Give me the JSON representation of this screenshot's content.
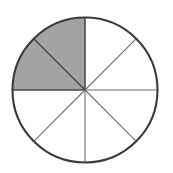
{
  "figure": {
    "kind": "fraction-circle",
    "alt_text": "A circle divided into 8 equal sectors; the two sectors forming the upper-left quarter are shaded gray, the other six are white."
  },
  "geometry": {
    "center_x": 85,
    "center_y": 90,
    "radius": 72.5,
    "total_sectors": 8,
    "sector_angle_degrees": 45,
    "start_angle_degrees": 0,
    "outline_width": 2.1,
    "spoke_width": 1.1
  },
  "colors": {
    "shaded_fill": "#a3a3a3",
    "empty_fill": "#ffffff",
    "outline_stroke": "#3b3b3b",
    "spoke_stroke": "#6e6e6e",
    "shaded_boundary_stroke": "#4a4a4a",
    "background": "#ffffff"
  },
  "chart_data": {
    "type": "pie",
    "categories": [
      "Sector 1 (0°–45°)",
      "Sector 2 (45°–90°)",
      "Sector 3 (90°–135°)",
      "Sector 4 (135°–180°)",
      "Sector 5 (180°–225°)",
      "Sector 6 (225°–270°)",
      "Sector 7 (270°–315°)",
      "Sector 8 (315°–360°)"
    ],
    "values": [
      12.5,
      12.5,
      12.5,
      12.5,
      12.5,
      12.5,
      12.5,
      12.5
    ],
    "shaded": [
      false,
      false,
      true,
      true,
      false,
      false,
      false,
      false
    ],
    "shaded_count": 2,
    "total_count": 8,
    "fraction_shaded": "2/8",
    "fraction_simplified": "1/4",
    "percent_shaded": 25,
    "xlabel": "",
    "ylabel": "",
    "legend": "none",
    "grid": false
  },
  "sectors": [
    {
      "index": 1,
      "start_deg": 0,
      "end_deg": 45,
      "fill_key": "empty_fill",
      "name": "sector-1"
    },
    {
      "index": 2,
      "start_deg": 45,
      "end_deg": 90,
      "fill_key": "empty_fill",
      "name": "sector-2"
    },
    {
      "index": 3,
      "start_deg": 90,
      "end_deg": 135,
      "fill_key": "shaded_fill",
      "name": "sector-3"
    },
    {
      "index": 4,
      "start_deg": 135,
      "end_deg": 180,
      "fill_key": "shaded_fill",
      "name": "sector-4"
    },
    {
      "index": 5,
      "start_deg": 180,
      "end_deg": 225,
      "fill_key": "empty_fill",
      "name": "sector-5"
    },
    {
      "index": 6,
      "start_deg": 225,
      "end_deg": 270,
      "fill_key": "empty_fill",
      "name": "sector-6"
    },
    {
      "index": 7,
      "start_deg": 270,
      "end_deg": 315,
      "fill_key": "empty_fill",
      "name": "sector-7"
    },
    {
      "index": 8,
      "start_deg": 315,
      "end_deg": 360,
      "fill_key": "empty_fill",
      "name": "sector-8"
    }
  ],
  "spokes": [
    {
      "index": 1,
      "angle_deg": 0,
      "name": "spoke-east"
    },
    {
      "index": 2,
      "angle_deg": 45,
      "name": "spoke-northeast"
    },
    {
      "index": 3,
      "angle_deg": 90,
      "name": "spoke-north"
    },
    {
      "index": 4,
      "angle_deg": 135,
      "name": "spoke-northwest"
    },
    {
      "index": 5,
      "angle_deg": 180,
      "name": "spoke-west"
    },
    {
      "index": 6,
      "angle_deg": 225,
      "name": "spoke-southwest"
    },
    {
      "index": 7,
      "angle_deg": 270,
      "name": "spoke-south"
    },
    {
      "index": 8,
      "angle_deg": 315,
      "name": "spoke-southeast"
    }
  ]
}
